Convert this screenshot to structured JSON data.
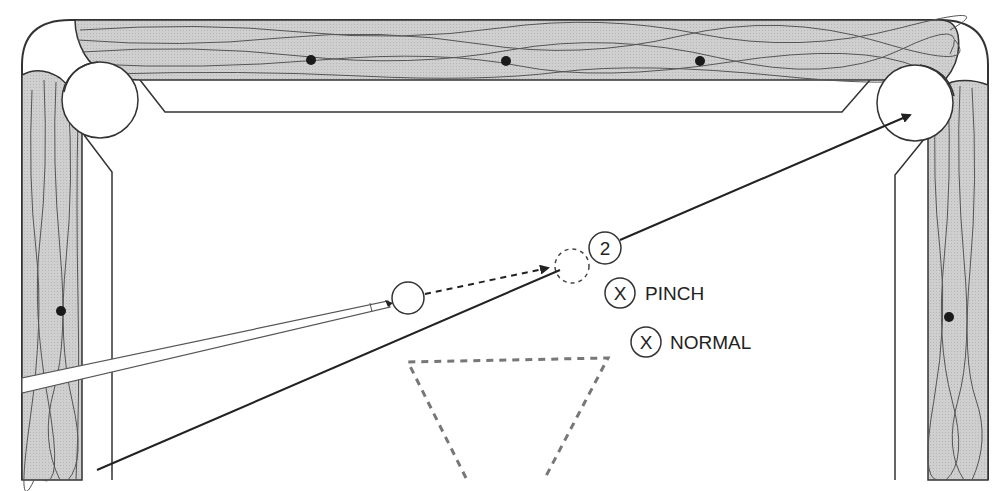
{
  "diagram": {
    "object_ball": {
      "number": "2"
    },
    "aim_points": [
      {
        "mark": "X",
        "label": "PINCH"
      },
      {
        "mark": "X",
        "label": "NORMAL"
      }
    ],
    "colors": {
      "rail_wood": "#c8c8c8",
      "grain": "#555555",
      "outline": "#333333",
      "rack_dash": "#777777",
      "diamond": "#1a1a1a"
    },
    "elements": {
      "top_rail_diamonds": 3,
      "side_rail_diamonds": 1,
      "corner_pockets": 2,
      "cue_stick": "cue-stick",
      "cue_ball": "cue-ball",
      "ghost_ball": "ghost-ball",
      "rack_triangle": "dashed-rack-outline"
    }
  }
}
